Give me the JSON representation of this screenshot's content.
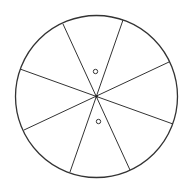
{
  "diagram": {
    "type": "divided-circle",
    "sections": 8,
    "stroke_color": "#333333",
    "background": "#ffffff",
    "circle": {
      "cx": 96.5,
      "cy": 96.5,
      "r": 81
    },
    "lines": [
      {
        "x1": 63,
        "y1": 24,
        "x2": 130,
        "y2": 170
      },
      {
        "x1": 123,
        "y1": 20,
        "x2": 70,
        "y2": 172
      },
      {
        "x1": 20,
        "y1": 69,
        "x2": 173,
        "y2": 124
      },
      {
        "x1": 24,
        "y1": 130,
        "x2": 169,
        "y2": 62
      }
    ],
    "markers": [
      {
        "cx": 95.5,
        "cy": 71.5,
        "r": 2.2
      },
      {
        "cx": 98.5,
        "cy": 121.5,
        "r": 2.2
      }
    ],
    "center_dot": {
      "cx": 96.5,
      "cy": 96.5,
      "r": 1.3
    }
  }
}
